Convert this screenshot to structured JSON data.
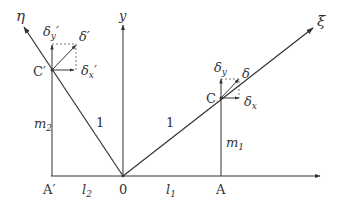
{
  "diagram": {
    "axes": {
      "y": "y",
      "xi": "ξ",
      "eta": "η"
    },
    "points": {
      "origin": "0",
      "A": "A",
      "A_prime": "A′",
      "C": "C",
      "C_prime": "C′"
    },
    "lengths": {
      "l1": "l",
      "l1_sub": "1",
      "l2": "l",
      "l2_sub": "2",
      "m1": "m",
      "m1_sub": "1",
      "m2": "m",
      "m2_sub": "2",
      "unit_right": "1",
      "unit_left": "1"
    },
    "displacements": {
      "delta": "δ",
      "delta_x": "δ",
      "delta_x_sub": "x",
      "delta_y": "δ",
      "delta_y_sub": "y",
      "delta_prime": "δ′",
      "delta_x_prime": "δ",
      "delta_x_prime_sub": "x",
      "delta_x_prime_mark": "′",
      "delta_y_prime": "δ",
      "delta_y_prime_sub": "y",
      "delta_y_prime_mark": "′"
    },
    "colors": {
      "line": "#333333",
      "dashed": "#555555",
      "background": "#ffffff"
    }
  }
}
